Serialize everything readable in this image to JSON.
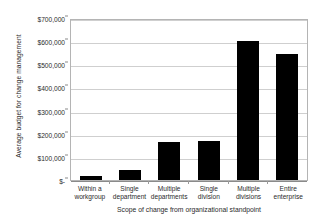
{
  "chart_data": {
    "type": "bar",
    "title": "",
    "xlabel": "Scope of change from organizational standpoint",
    "ylabel": "Average budget for change management",
    "categories": [
      "Within a workgroup",
      "Single department",
      "Multiple departments",
      "Single division",
      "Multiple divisions",
      "Entire enterprise"
    ],
    "values": [
      18000,
      42000,
      163000,
      170000,
      600000,
      545000
    ],
    "ylim": [
      0,
      700000
    ],
    "ytick_values": [
      0,
      100000,
      200000,
      300000,
      400000,
      500000,
      600000,
      700000
    ],
    "ytick_labels": [
      "$-",
      "$100,000",
      "$200,000",
      "$300,000",
      "$400,000",
      "$500,000",
      "$600,000",
      "$700,000"
    ],
    "grid": true,
    "legend": false,
    "bar_color": "#000000",
    "grid_color": "#cfcfcf",
    "axis_color": "#8a8a8a",
    "text_color": "#2b2b2b"
  }
}
